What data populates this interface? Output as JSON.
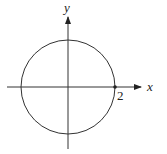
{
  "diagram": {
    "type": "coordinate-plane-circle",
    "axes": {
      "x_label": "x",
      "y_label": "y"
    },
    "circle": {
      "center": [
        0,
        0
      ],
      "radius": 2
    },
    "marked_point": {
      "x": 2,
      "y": 0,
      "label": "2"
    },
    "colors": {
      "stroke": "#333333",
      "background": "#ffffff"
    }
  }
}
